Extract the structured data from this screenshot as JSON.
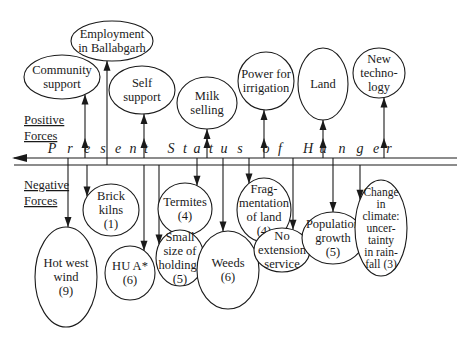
{
  "diagram": {
    "title_letters": [
      {
        "ch": "P",
        "x": 52
      },
      {
        "ch": "r",
        "x": 70
      },
      {
        "ch": "e",
        "x": 87
      },
      {
        "ch": "s",
        "x": 103
      },
      {
        "ch": "e",
        "x": 118
      },
      {
        "ch": "n",
        "x": 133
      },
      {
        "ch": "t",
        "x": 146
      },
      {
        "ch": "S",
        "x": 171
      },
      {
        "ch": "t",
        "x": 185
      },
      {
        "ch": "a",
        "x": 197
      },
      {
        "ch": "t",
        "x": 211
      },
      {
        "ch": "u",
        "x": 224
      },
      {
        "ch": "s",
        "x": 240
      },
      {
        "ch": "o",
        "x": 266
      },
      {
        "ch": "f",
        "x": 280
      },
      {
        "ch": "H",
        "x": 308
      },
      {
        "ch": "u",
        "x": 323
      },
      {
        "ch": "n",
        "x": 342
      },
      {
        "ch": "g",
        "x": 360
      },
      {
        "ch": "e",
        "x": 376
      },
      {
        "ch": "r",
        "x": 389
      }
    ],
    "positive_label": [
      "Positive",
      "Forces"
    ],
    "negative_label": [
      "Negative",
      "Forces"
    ],
    "positive_forces": [
      {
        "id": "community-support",
        "lines": [
          "Community",
          "support"
        ],
        "cx": 62,
        "cy": 77,
        "rx": 38,
        "ry": 22,
        "arrow_x": 85,
        "double_arrow": true
      },
      {
        "id": "employment-ballabgarh",
        "lines": [
          "Employment",
          "in Ballabgarh"
        ],
        "cx": 112,
        "cy": 41,
        "rx": 41,
        "ry": 20,
        "arrow_x": 107,
        "double_arrow": false
      },
      {
        "id": "self-support",
        "lines": [
          "Self",
          "support"
        ],
        "cx": 142,
        "cy": 90,
        "rx": 33,
        "ry": 24,
        "arrow_x": 144,
        "double_arrow": true
      },
      {
        "id": "milk-selling",
        "lines": [
          "Milk",
          "selling"
        ],
        "cx": 207,
        "cy": 103,
        "rx": 30,
        "ry": 26,
        "arrow_x": 207,
        "double_arrow": true
      },
      {
        "id": "power-for-irrigation",
        "lines": [
          "Power for",
          "irrigation"
        ],
        "cx": 266,
        "cy": 81,
        "rx": 28,
        "ry": 29,
        "arrow_x": 264,
        "double_arrow": true
      },
      {
        "id": "land",
        "lines": [
          "Land"
        ],
        "cx": 323,
        "cy": 84,
        "rx": 25,
        "ry": 36,
        "arrow_x": 323,
        "double_arrow": true
      },
      {
        "id": "new-technology",
        "lines": [
          "New",
          "techno-",
          "logy"
        ],
        "cx": 379,
        "cy": 73,
        "rx": 26,
        "ry": 25,
        "arrow_x": 384,
        "double_arrow": true
      }
    ],
    "negative_forces": [
      {
        "id": "brick-kilns",
        "lines": [
          "Brick",
          "kilns",
          "(1)"
        ],
        "score": 1,
        "cx": 111,
        "cy": 210,
        "rx": 28,
        "ry": 26,
        "arrow_x": 87
      },
      {
        "id": "hot-west-wind",
        "lines": [
          "Hot west",
          "wind",
          "(9)"
        ],
        "score": 9,
        "cx": 66,
        "cy": 277,
        "rx": 31,
        "ry": 50,
        "arrow_x": 68
      },
      {
        "id": "hu-a",
        "lines": [
          "HU A*",
          "(6)"
        ],
        "score": 6,
        "cx": 130,
        "cy": 273,
        "rx": 25,
        "ry": 27,
        "arrow_x": 144
      },
      {
        "id": "termites",
        "lines": [
          "Termites",
          "(4)"
        ],
        "score": 4,
        "cx": 185,
        "cy": 209,
        "rx": 27,
        "ry": 26,
        "arrow_x": 197
      },
      {
        "id": "small-size-of-holdings",
        "lines": [
          "Small",
          "size of",
          "holdings",
          "(5)"
        ],
        "score": 5,
        "cx": 180,
        "cy": 258,
        "rx": 24,
        "ry": 28,
        "arrow_x": 159
      },
      {
        "id": "weeds",
        "lines": [
          "Weeds",
          "(6)"
        ],
        "score": 6,
        "cx": 228,
        "cy": 270,
        "rx": 31,
        "ry": 39,
        "arrow_x": 223
      },
      {
        "id": "fragmentation-of-land",
        "lines": [
          "Frag-",
          "mentation",
          "of land",
          "(4)"
        ],
        "score": 4,
        "cx": 264,
        "cy": 210,
        "rx": 27,
        "ry": 32,
        "arrow_x": 249
      },
      {
        "id": "no-extension-service",
        "lines": [
          "No",
          "extension",
          "service"
        ],
        "score": null,
        "cx": 282,
        "cy": 250,
        "rx": 28,
        "ry": 22,
        "arrow_x": 293
      },
      {
        "id": "population-growth",
        "lines": [
          "Population",
          "growth",
          "(5)"
        ],
        "score": 5,
        "cx": 333,
        "cy": 238,
        "rx": 31,
        "ry": 26,
        "arrow_x": 333
      },
      {
        "id": "change-in-climate",
        "lines": [
          "Change",
          "in",
          "climate:",
          "uncer-",
          "tainty",
          "in rain-",
          "fall (3)"
        ],
        "score": 3,
        "cx": 381,
        "cy": 228,
        "rx": 26,
        "ry": 48,
        "arrow_x": 360
      }
    ],
    "tick_marks_x": [
      68,
      107,
      197,
      223,
      249,
      293,
      333
    ],
    "colors": {
      "ink": "#1a1a1a",
      "background": "#ffffff"
    }
  }
}
